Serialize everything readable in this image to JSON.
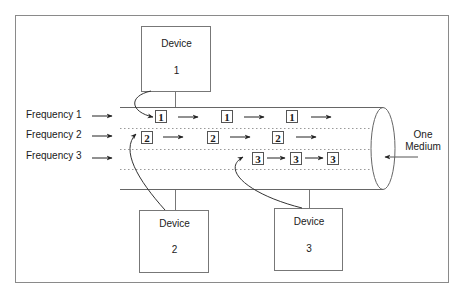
{
  "diagram": {
    "frame_color": "#8a8a8a",
    "line_color": "#555555",
    "frequencies": [
      {
        "label": "Frequency 1"
      },
      {
        "label": "Frequency 2"
      },
      {
        "label": "Frequency 3"
      }
    ],
    "devices": [
      {
        "title": "Device",
        "number": "1"
      },
      {
        "title": "Device",
        "number": "2"
      },
      {
        "title": "Device",
        "number": "3"
      }
    ],
    "medium": {
      "line1": "One",
      "line2": "Medium"
    },
    "channels": [
      {
        "packets": [
          "1",
          "1",
          "1"
        ]
      },
      {
        "packets": [
          "2",
          "2",
          "2"
        ]
      },
      {
        "packets": [
          "3",
          "3",
          "3"
        ]
      }
    ]
  }
}
